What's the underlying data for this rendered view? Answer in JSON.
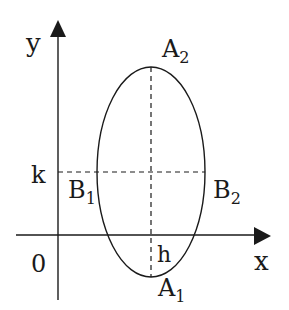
{
  "diagram": {
    "axes": {
      "x_label": "x",
      "y_label": "y",
      "origin_label": "0"
    },
    "center": {
      "h_label": "h",
      "k_label": "k"
    },
    "vertices": {
      "top": {
        "letter": "A",
        "sub": "2"
      },
      "bottom": {
        "letter": "A",
        "sub": "1"
      }
    },
    "co_vertices": {
      "left": {
        "letter": "B",
        "sub": "1"
      },
      "right": {
        "letter": "B",
        "sub": "2"
      }
    },
    "colors": {
      "stroke": "#1a1a1a",
      "background": "#ffffff"
    }
  }
}
